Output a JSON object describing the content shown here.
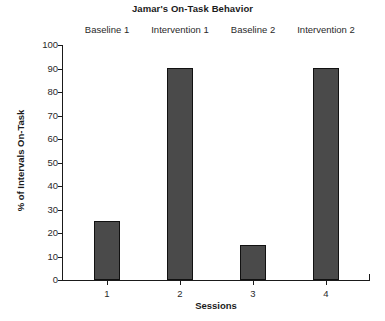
{
  "chart_data": {
    "type": "bar",
    "title": "Jamar's On-Task Behavior",
    "xlabel": "Sessions",
    "ylabel": "% of Intervals On-Task",
    "categories": [
      "1",
      "2",
      "3",
      "4"
    ],
    "values": [
      25,
      90,
      15,
      90
    ],
    "ylim": [
      0,
      100
    ],
    "ytick_step": 10,
    "yticks": [
      "100",
      "90",
      "80",
      "70",
      "60",
      "50",
      "40",
      "30",
      "20",
      "10",
      "0"
    ],
    "xticks": [
      "1",
      "2",
      "3",
      "4"
    ],
    "grid": false,
    "legend": null,
    "bar_color": "#4a4a4a",
    "bar_edge_color": "#111111",
    "axis_color": "#1a1a1a",
    "annotations": [
      {
        "label": "Baseline 1",
        "session": "1"
      },
      {
        "label": "Intervention 1",
        "session": "2"
      },
      {
        "label": "Baseline 2",
        "session": "3"
      },
      {
        "label": "Intervention 2",
        "session": "4"
      }
    ]
  }
}
